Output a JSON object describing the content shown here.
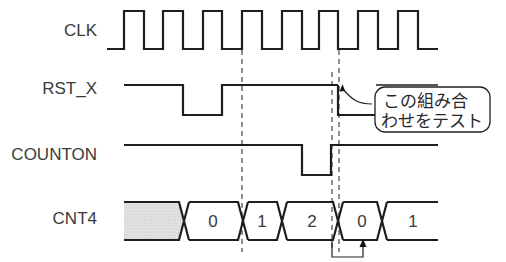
{
  "diagram": {
    "type": "timing-diagram",
    "signals": [
      {
        "name": "CLK",
        "kind": "clock"
      },
      {
        "name": "RST_X",
        "kind": "digital"
      },
      {
        "name": "COUNTON",
        "kind": "digital"
      },
      {
        "name": "CNT4",
        "kind": "bus"
      }
    ],
    "bus_values": [
      "0",
      "1",
      "2",
      "0",
      "1"
    ],
    "bus_initial": "unknown (shaded)",
    "callout": {
      "line1": "この組み合",
      "line2": "わせをテスト"
    },
    "colors": {
      "wave": "#1e1e1e",
      "label": "#3a3a3a",
      "shaded": "#d9d9d9"
    }
  }
}
